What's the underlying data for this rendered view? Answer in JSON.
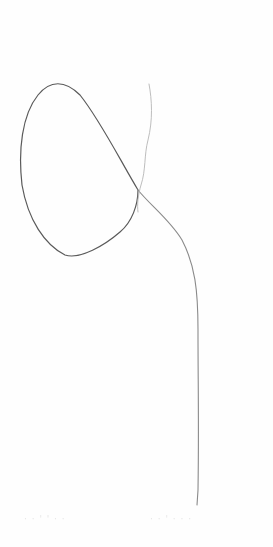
{
  "image": {
    "description": "Pencil line drawing on white paper: a closed rounded loop at upper-left with a line crossing it, descending in a long near-vertical stroke toward the bottom.",
    "colors": {
      "paper": "#fefefe",
      "stroke_dark": "#5a5a5a",
      "stroke_light": "#a8a8a8"
    }
  }
}
